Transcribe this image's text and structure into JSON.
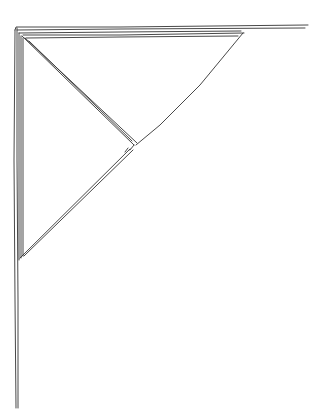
{
  "image": {
    "description": "Hand-drawn line sketch of a corner shelf bracket (L-shaped angle with diagonal brace)",
    "stroke_color": "#333333",
    "background": "#ffffff"
  }
}
